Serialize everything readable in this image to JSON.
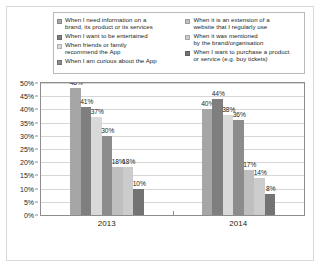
{
  "chart_data": {
    "type": "bar",
    "title": "",
    "subtitle": "",
    "xlabel": "",
    "ylabel": "",
    "categories": [
      "2013",
      "2014"
    ],
    "ylim": [
      0,
      50
    ],
    "ytick_labels": [
      "0%",
      "5%",
      "10%",
      "15%",
      "20%",
      "25%",
      "30%",
      "35%",
      "40%",
      "45%",
      "50%"
    ],
    "ytick_values": [
      0,
      5,
      10,
      15,
      20,
      25,
      30,
      35,
      40,
      45,
      50
    ],
    "grid": true,
    "legend_position": "top",
    "value_suffix": "%",
    "series": [
      {
        "name": "When I need information on a\nbrand, its product or its services",
        "color": "#a6a6a6",
        "values": [
          48,
          40
        ],
        "labels": [
          "48%",
          "40%"
        ]
      },
      {
        "name": "When I want to be entertained",
        "color": "#7f7f7f",
        "values": [
          41,
          44
        ],
        "labels": [
          "41%",
          "44%"
        ]
      },
      {
        "name": "When friends or family\nrecommend the App",
        "color": "#d9d9d9",
        "values": [
          37,
          38
        ],
        "labels": [
          "37%",
          "38%"
        ]
      },
      {
        "name": "When I am curious about the App",
        "color": "#8c8c8c",
        "values": [
          30,
          36
        ],
        "labels": [
          "30%",
          "36%"
        ]
      },
      {
        "name": "When it is an extension of a\nwebsite that I regularly use",
        "color": "#bfbfbf",
        "values": [
          18,
          17
        ],
        "labels": [
          "18%",
          "17%"
        ]
      },
      {
        "name": "When it was mentioned\nby the brand/organisation",
        "color": "#cccccc",
        "values": [
          18,
          14
        ],
        "labels": [
          "18%",
          "14%"
        ]
      },
      {
        "name": "When I want to purchase a product\nor service (e.g. buy tickets)",
        "color": "#737373",
        "values": [
          10,
          8
        ],
        "labels": [
          "10%",
          "8%"
        ]
      }
    ]
  },
  "legend": {
    "columns": [
      {
        "entries": [
          {
            "label": "When I need information on a\nbrand, its product or its services",
            "color": "#a6a6a6"
          },
          {
            "label": "When I want to be entertained",
            "color": "#7f7f7f"
          },
          {
            "label": "When friends or family\nrecommend the App",
            "color": "#d9d9d9"
          },
          {
            "label": "When I am curious about the App",
            "color": "#8c8c8c"
          }
        ]
      },
      {
        "entries": [
          {
            "label": "When it is an extension of a\nwebsite that I regularly use",
            "color": "#bfbfbf"
          },
          {
            "label": "When it was mentioned\nby the brand/organisation",
            "color": "#cccccc"
          },
          {
            "label": "When I want to purchase a product\nor service (e.g. buy tickets)",
            "color": "#737373"
          }
        ]
      }
    ]
  },
  "axis": {
    "frame_color": "#8d8d8d",
    "grid_color": "#d6d6d6"
  }
}
